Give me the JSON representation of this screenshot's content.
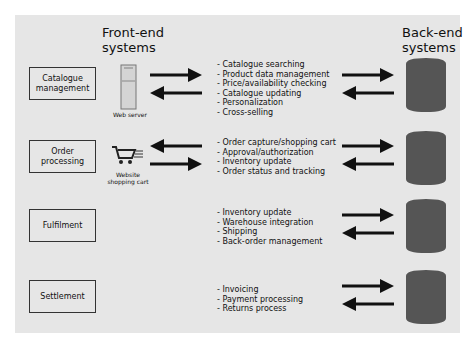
{
  "headers": {
    "front_end": "Front-end\nsystems",
    "front_end_l1": "Front-end",
    "front_end_l2": "systems",
    "back_end_l1": "Back-end",
    "back_end_l2": "systems"
  },
  "rows": [
    {
      "process": "Catalogue management",
      "process_l1": "Catalogue",
      "process_l2": "management",
      "front_icon": "web-server-icon",
      "front_caption_l1": "Web server",
      "front_caption_l2": "",
      "front_arrows": [
        "right",
        "left"
      ],
      "functions": [
        "- Catalogue searching",
        "- Product data management",
        "- Price/availability checking",
        "- Catalogue updating",
        "- Personalization",
        "- Cross-selling"
      ],
      "back_arrows": [
        "right",
        "left"
      ]
    },
    {
      "process": "Order processing",
      "process_l1": "Order",
      "process_l2": "processing",
      "front_icon": "shopping-cart-icon",
      "front_caption_l1": "Website",
      "front_caption_l2": "shopping cart",
      "front_arrows": [
        "left",
        "right"
      ],
      "functions": [
        "- Order capture/shopping cart",
        "- Approval/authorization",
        "- Inventory update",
        "- Order status and tracking"
      ],
      "back_arrows": [
        "right",
        "left"
      ]
    },
    {
      "process": "Fulfilment",
      "process_l1": "Fulfilment",
      "process_l2": "",
      "functions": [
        "- Inventory update",
        "- Warehouse integration",
        "- Shipping",
        "- Back-order management"
      ],
      "back_arrows": [
        "right",
        "left"
      ]
    },
    {
      "process": "Settlement",
      "process_l1": "Settlement",
      "process_l2": "",
      "functions": [
        "- Invoicing",
        "- Payment processing",
        "- Returns process"
      ],
      "back_arrows": [
        "right",
        "left"
      ]
    }
  ],
  "colors": {
    "panel": "#e6e6e6",
    "database": "#555555",
    "arrow": "#111111"
  }
}
